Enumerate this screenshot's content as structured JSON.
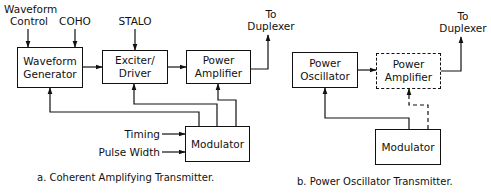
{
  "diagram_a": {
    "caption": "a. Coherent Amplifying Transmitter.",
    "inputs": {
      "waveform_control": "Waveform\nControl",
      "coho": "COHO",
      "stalo": "STALO",
      "timing": "Timing",
      "pulse_width": "Pulse Width"
    },
    "output": "To\nDuplexer",
    "blocks": {
      "waveform_generator": "Waveform Generator",
      "exciter_driver": "Exciter/ Driver",
      "power_amplifier": "Power Amplifier",
      "modulator": "Modulator"
    }
  },
  "diagram_b": {
    "caption": "b. Power Oscillator Transmitter.",
    "output": "To\nDuplexer",
    "blocks": {
      "power_oscillator": "Power Oscillator",
      "power_amplifier": "Power Amplifier",
      "modulator": "Modulator"
    }
  },
  "colors": {
    "line": "#111111",
    "background": "#ffffff"
  }
}
